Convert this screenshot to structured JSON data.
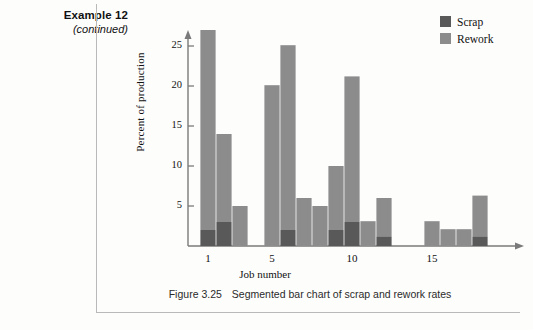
{
  "margin_note": {
    "title": "Example 12",
    "subtitle": "(continued)"
  },
  "figure": {
    "caption_number": "Figure 3.25",
    "caption_text": "Segmented bar chart of scrap and rework rates"
  },
  "legend": {
    "items": [
      {
        "label": "Scrap",
        "color": "#595959"
      },
      {
        "label": "Rework",
        "color": "#8c8c8c"
      }
    ]
  },
  "colors": {
    "scrap": "#595959",
    "rework": "#8c8c8c",
    "axis": "#7a7a7a",
    "text": "#111111",
    "page_background": "#fdfdfc",
    "rule": "#b9b9b9"
  },
  "chart_data": {
    "type": "bar",
    "subtype": "stacked",
    "title": "",
    "xlabel": "Job number",
    "ylabel": "Percent of production",
    "categories": [
      1,
      2,
      3,
      5,
      6,
      7,
      8,
      9,
      10,
      11,
      12,
      15,
      16,
      17,
      18
    ],
    "series": [
      {
        "name": "Scrap",
        "color": "#595959",
        "values": [
          2.0,
          3.0,
          0.0,
          0.0,
          2.0,
          0.0,
          0.0,
          2.0,
          3.0,
          0.0,
          1.2,
          0.0,
          0.0,
          0.0,
          1.2
        ]
      },
      {
        "name": "Rework",
        "color": "#8c8c8c",
        "values": [
          25.0,
          11.0,
          5.0,
          20.1,
          23.1,
          6.0,
          5.0,
          8.0,
          18.2,
          3.1,
          4.8,
          3.1,
          2.1,
          2.1,
          5.1
        ]
      }
    ],
    "totals": [
      27.0,
      14.0,
      5.0,
      20.1,
      25.1,
      6.0,
      5.0,
      10.0,
      21.2,
      3.1,
      6.0,
      3.1,
      2.1,
      2.1,
      6.3
    ],
    "ylim": [
      0,
      28
    ],
    "yticks": [
      5,
      10,
      15,
      20,
      25
    ],
    "ytick_labels": [
      "5",
      "10",
      "15",
      "20",
      "25"
    ],
    "xlim": [
      0,
      19.5
    ],
    "xticks": [
      1,
      5,
      10,
      15
    ],
    "xtick_labels": [
      "1",
      "5",
      "10",
      "15"
    ],
    "grid": false,
    "legend_position": "top-right",
    "axis_style": "arrow-ended"
  }
}
